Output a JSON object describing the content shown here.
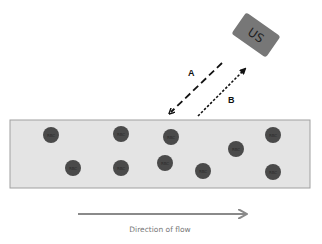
{
  "diagram": {
    "transducer": {
      "label": "US",
      "color": "#777777"
    },
    "beams": [
      {
        "id": "A",
        "label": "A",
        "style": "long-dash",
        "direction": "toward-vessel"
      },
      {
        "id": "B",
        "label": "B",
        "style": "short-dash",
        "direction": "toward-transducer"
      }
    ],
    "vessel": {
      "fill": "#e4e4e4",
      "border": "#9a9a9a"
    },
    "rbc": {
      "label": "RBC",
      "color": "#4a4a4a",
      "cells": [
        {
          "x": 51,
          "y": 135
        },
        {
          "x": 73,
          "y": 168
        },
        {
          "x": 121,
          "y": 134
        },
        {
          "x": 121,
          "y": 168
        },
        {
          "x": 171,
          "y": 137
        },
        {
          "x": 165,
          "y": 163
        },
        {
          "x": 203,
          "y": 171
        },
        {
          "x": 236,
          "y": 149
        },
        {
          "x": 273,
          "y": 135
        },
        {
          "x": 273,
          "y": 172
        }
      ]
    },
    "flow": {
      "label": "Direction of flow",
      "arrow_color": "#8a8a8a"
    }
  }
}
